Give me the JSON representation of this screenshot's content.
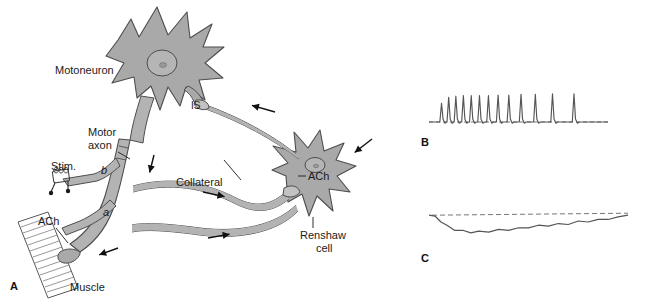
{
  "figure": {
    "colors": {
      "cell_fill": "#a9a9a9",
      "axon_fill": "#b3b3b3",
      "outline": "#4d4d4d",
      "trace": "#555555",
      "dashed_baseline": "#777777",
      "text": "#1a1a1a",
      "background": "#ffffff"
    }
  },
  "panels": {
    "a": {
      "letter": "A",
      "labels": {
        "motoneuron": "Motoneuron",
        "motor_axon_line1": "Motor",
        "motor_axon_line2": "axon",
        "initial_segment": "IS",
        "collateral": "Collateral",
        "stim": "Stim.",
        "branch_b": "b",
        "branch_a": "a",
        "ach_muscle": "ACh",
        "ach_renshaw": "ACh",
        "renshaw_line1": "Renshaw",
        "renshaw_line2": "cell",
        "muscle": "Muscle"
      },
      "icons": {
        "stim_electrode": "stimulating-electrode-icon",
        "nucleus": "nucleus-icon",
        "muscle_fiber": "muscle-fiber-icon",
        "flow_arrow": "flow-arrow-icon"
      }
    },
    "b": {
      "letter": "B",
      "description": "Adapting action potential train recorded from motoneuron"
    },
    "c": {
      "letter": "C",
      "description": "Hyperpolarizing inhibitory postsynaptic potential"
    }
  },
  "chart_data": [
    {
      "type": "line",
      "name": "panel-b-spike-train",
      "title": "B",
      "xlabel": "",
      "ylabel": "",
      "grid": false,
      "legend": null,
      "baseline_style": "dashed",
      "xlim": [
        0,
        100
      ],
      "ylim": [
        0,
        100
      ],
      "comment": "Spike train with progressively increasing inter-spike interval (adaptation). Positions are percent of trace width; amplitudes percent of full height.",
      "spike_positions": [
        7.0,
        11.0,
        15.0,
        19.2,
        23.6,
        28.2,
        33.2,
        38.6,
        44.6,
        51.4,
        59.4,
        69.0,
        81.0
      ],
      "spike_amplitudes": [
        62,
        82,
        86,
        88,
        88,
        88,
        88,
        90,
        90,
        92,
        92,
        94,
        94
      ],
      "baseline_level": 8
    },
    {
      "type": "line",
      "name": "panel-c-ipsp",
      "title": "C",
      "xlabel": "",
      "ylabel": "",
      "grid": false,
      "legend": null,
      "baseline_style": "dashed",
      "xlim": [
        0,
        100
      ],
      "ylim": [
        0,
        100
      ],
      "comment": "Hyperpolarizing IPSP: trace drops below resting dashed baseline then slowly recovers, with small ripples.",
      "baseline_level": 70,
      "x": [
        0,
        3,
        6,
        9,
        13,
        17,
        21,
        25,
        30,
        35,
        40,
        45,
        50,
        55,
        60,
        65,
        70,
        75,
        80,
        85,
        90,
        95,
        100
      ],
      "y": [
        70,
        69,
        63,
        57,
        53,
        51,
        50,
        50,
        51,
        52,
        53,
        54,
        56,
        57,
        58,
        59,
        60,
        62,
        63,
        64,
        66,
        67,
        70
      ]
    }
  ]
}
